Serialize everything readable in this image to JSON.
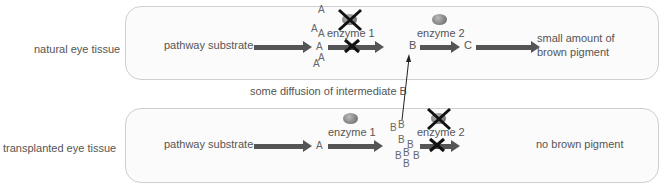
{
  "rows": {
    "natural": {
      "label": "natural eye tissue",
      "substrate": "pathway substrate",
      "enzyme1": "enzyme 1",
      "enzyme2": "enzyme 2",
      "intermediate_A": "A",
      "intermediate_B": "B",
      "product_C": "C",
      "outcome_line1": "small amount of",
      "outcome_line2": "brown pigment"
    },
    "transplanted": {
      "label": "transplanted  eye tissue",
      "substrate": "pathway substrate",
      "enzyme1": "enzyme 1",
      "enzyme2": "enzyme 2",
      "intermediate_A": "A",
      "intermediate_B": "B",
      "outcome": "no brown pigment"
    }
  },
  "diffusion_label": "some diffusion of intermediate B",
  "letters": {
    "A": "A",
    "B": "B"
  },
  "colors": {
    "arrow": "#555555",
    "box_border": "#cfcfcf",
    "text": "#555555"
  }
}
